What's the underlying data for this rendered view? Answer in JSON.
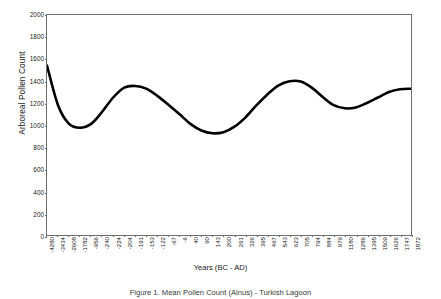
{
  "chart_data": {
    "type": "line",
    "title": "",
    "xlabel": "Years (BC - AD)",
    "ylabel": "Arboreal Pollen Count",
    "ylim": [
      0,
      2000
    ],
    "ytick_step": 200,
    "yticks": [
      0,
      200,
      400,
      600,
      800,
      1000,
      1200,
      1400,
      1600,
      1800,
      2000
    ],
    "grid": false,
    "legend": "none",
    "line_color": "#000000",
    "frame_color": "#6f6f6f",
    "background": "#ffffff",
    "categories": [
      "-4280",
      "-3434",
      "-2608",
      "-1782",
      "-956",
      "-240",
      "-224",
      "-204",
      "-191",
      "-153",
      "-122",
      "-67",
      "-6",
      "40",
      "90",
      "143",
      "200",
      "261",
      "326",
      "395",
      "467",
      "543",
      "623",
      "705",
      "794",
      "884",
      "979",
      "1180",
      "1286",
      "1395",
      "1509",
      "1626",
      "1747",
      "1872"
    ],
    "values": [
      1540,
      1180,
      1010,
      975,
      1010,
      1120,
      1250,
      1340,
      1355,
      1330,
      1265,
      1185,
      1100,
      1010,
      950,
      925,
      935,
      985,
      1070,
      1180,
      1280,
      1360,
      1398,
      1395,
      1340,
      1255,
      1180,
      1152,
      1160,
      1200,
      1250,
      1300,
      1325,
      1330
    ]
  },
  "caption": "Figure 1. Mean Pollen Count (Alnus) - Turkish Lagoon"
}
